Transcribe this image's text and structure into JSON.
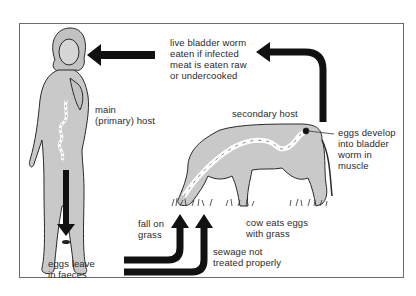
{
  "diagram": {
    "type": "life-cycle",
    "colors": {
      "frame": "#6b6b6b",
      "host_fill": "#c9c9c9",
      "outline": "#2a2a2a",
      "arrow": "#111111",
      "text": "#2b2b2b",
      "background": "#ffffff"
    },
    "nodes": [
      {
        "id": "human",
        "label": "main\n(primary) host"
      },
      {
        "id": "cow",
        "label": "secondary host"
      }
    ],
    "labels": {
      "live_bladder_worm": "live bladder worm\neaten if infected\nmeat is eaten raw\nor undercooked",
      "main_host": "main\n(primary) host",
      "secondary_host": "secondary host",
      "eggs_develop": "eggs develop\ninto bladder\nworm in\nmuscle",
      "eggs_leave": "eggs leave\nin faeces",
      "fall_on_grass": "fall on\ngrass",
      "cow_eats": "cow eats eggs\nwith grass",
      "sewage": "sewage not\ntreated properly"
    },
    "edges": [
      {
        "from": "human",
        "to": "grass",
        "label": "eggs leave\nin faeces"
      },
      {
        "from": "faeces",
        "to": "grass",
        "label": "fall on\ngrass"
      },
      {
        "from": "faeces",
        "to": "grass",
        "label": "sewage not\ntreated properly"
      },
      {
        "from": "grass",
        "to": "cow",
        "label": "cow eats eggs\nwith grass"
      },
      {
        "from": "cow",
        "to": "cow-muscle",
        "label": "eggs develop\ninto bladder\nworm in\nmuscle"
      },
      {
        "from": "cow",
        "to": "human",
        "label": "live bladder worm\neaten if infected\nmeat is eaten raw\nor undercooked"
      }
    ]
  }
}
